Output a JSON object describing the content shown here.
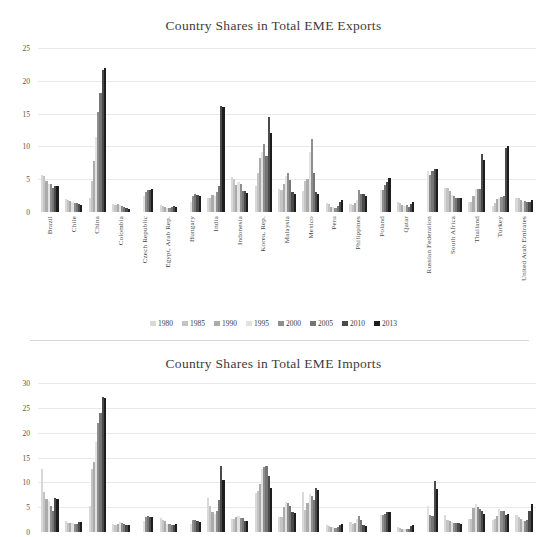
{
  "figure": {
    "divider_color": "#d8d8d8",
    "background": "#ffffff",
    "grid_color": "#e9e9e9"
  },
  "legend": {
    "position": "bottom-center",
    "entries": [
      {
        "label": "1980",
        "color": "#d9d9d9"
      },
      {
        "label": "1985",
        "color": "#c4c4c4"
      },
      {
        "label": "1990",
        "color": "#ababab"
      },
      {
        "label": "1995",
        "color": "#e2e2e2"
      },
      {
        "label": "2000",
        "color": "#8e8e8e"
      },
      {
        "label": "2005",
        "color": "#757575"
      },
      {
        "label": "2010",
        "color": "#4a4a4a"
      },
      {
        "label": "2013",
        "color": "#1d1d1d"
      }
    ]
  },
  "chart_data": [
    {
      "type": "bar",
      "title": "Country Shares in Total EME Exports",
      "xlabel": "",
      "ylabel": "",
      "ylim": [
        0,
        25
      ],
      "yticks": [
        0,
        5,
        10,
        15,
        20,
        25
      ],
      "grid": true,
      "legend_position": "bottom",
      "categories": [
        "Brazil",
        "Chile",
        "China",
        "Colombia",
        "Czech Republic",
        "Egypt, Arab Rep.",
        "Hungary",
        "India",
        "Indonesia",
        "Korea, Rep.",
        "Malaysia",
        "Mexico",
        "Peru",
        "Philippines",
        "Poland",
        "Qatar",
        "Russian Federation",
        "South Africa",
        "Thailand",
        "Turkey",
        "United Arab Emirates"
      ],
      "series": [
        {
          "name": "1980",
          "values": [
            5.6,
            2.0,
            2.2,
            1.2,
            0.0,
            1.0,
            0.0,
            2.1,
            5.3,
            4.0,
            3.5,
            3.2,
            1.4,
            1.2,
            0.0,
            1.6,
            0.0,
            3.6,
            1.6,
            0.9,
            2.1
          ]
        },
        {
          "name": "1985",
          "values": [
            5.5,
            1.9,
            4.7,
            1.1,
            0.0,
            0.9,
            0.0,
            2.1,
            5.0,
            6.0,
            3.3,
            4.8,
            1.2,
            1.1,
            0.0,
            1.4,
            0.0,
            3.7,
            1.5,
            1.3,
            2.1
          ]
        },
        {
          "name": "1990",
          "values": [
            4.7,
            1.7,
            7.8,
            1.2,
            0.0,
            0.8,
            0.0,
            2.6,
            4.1,
            8.3,
            4.3,
            5.0,
            0.8,
            1.3,
            0.0,
            1.0,
            0.0,
            3.2,
            2.5,
            2.0,
            1.8
          ]
        },
        {
          "name": "1995",
          "values": [
            4.3,
            1.6,
            11.5,
            1.1,
            2.4,
            0.6,
            1.5,
            2.4,
            4.6,
            9.2,
            5.5,
            9.2,
            0.7,
            1.8,
            3.3,
            0.9,
            6.2,
            2.6,
            3.5,
            2.1,
            1.5
          ]
        },
        {
          "name": "2000",
          "values": [
            4.2,
            1.4,
            15.2,
            0.9,
            3.1,
            0.6,
            2.4,
            3.0,
            4.2,
            10.4,
            6.0,
            11.1,
            0.6,
            3.3,
            3.4,
            1.0,
            5.6,
            2.4,
            3.5,
            2.3,
            1.7
          ]
        },
        {
          "name": "2005",
          "values": [
            3.7,
            1.4,
            18.1,
            0.8,
            3.4,
            0.7,
            2.7,
            4.0,
            3.2,
            8.6,
            4.9,
            6.0,
            0.9,
            2.7,
            4.1,
            0.8,
            6.2,
            2.1,
            3.5,
            2.5,
            1.6
          ]
        },
        {
          "name": "2010",
          "values": [
            4.0,
            1.2,
            21.7,
            0.6,
            3.3,
            0.9,
            2.6,
            16.2,
            3.2,
            14.5,
            3.0,
            3.0,
            1.6,
            2.7,
            4.5,
            1.2,
            6.5,
            2.2,
            8.8,
            9.7,
            1.5
          ]
        },
        {
          "name": "2013",
          "values": [
            3.9,
            1.1,
            21.9,
            0.5,
            3.5,
            0.7,
            2.4,
            16.0,
            2.9,
            12.1,
            2.8,
            2.8,
            1.8,
            2.5,
            5.2,
            1.6,
            6.6,
            2.1,
            8.0,
            10.0,
            1.9
          ]
        }
      ]
    },
    {
      "type": "bar",
      "title": "Country Shares in Total EME Imports",
      "xlabel": "",
      "ylabel": "",
      "ylim": [
        0,
        30
      ],
      "yticks": [
        0,
        5,
        10,
        15,
        20,
        25,
        30
      ],
      "grid": true,
      "legend_position": "bottom",
      "categories": [
        "Brazil",
        "Chile",
        "China",
        "Colombia",
        "Czech Republic",
        "Egypt, Arab Rep.",
        "Hungary",
        "India",
        "Indonesia",
        "Korea, Rep.",
        "Malaysia",
        "Mexico",
        "Peru",
        "Philippines",
        "Poland",
        "Qatar",
        "Russian Federation",
        "South Africa",
        "Thailand",
        "Turkey",
        "United Arab Emirates"
      ],
      "series": [
        {
          "name": "1980",
          "values": [
            12.6,
            2.2,
            5.3,
            1.6,
            0.0,
            2.8,
            0.0,
            6.9,
            2.6,
            7.8,
            3.0,
            8.1,
            1.4,
            2.0,
            0.0,
            1.0,
            0.0,
            3.4,
            2.7,
            2.5,
            3.4
          ]
        },
        {
          "name": "1985",
          "values": [
            8.1,
            1.8,
            12.7,
            1.5,
            0.0,
            2.5,
            0.0,
            5.2,
            2.6,
            8.2,
            3.1,
            4.5,
            1.2,
            1.6,
            0.0,
            0.9,
            0.0,
            2.5,
            2.6,
            2.6,
            3.0
          ]
        },
        {
          "name": "1990",
          "values": [
            6.6,
            1.8,
            14.0,
            1.6,
            0.0,
            2.2,
            0.0,
            4.0,
            3.0,
            9.7,
            5.1,
            5.8,
            1.0,
            1.9,
            0.0,
            0.7,
            0.0,
            2.3,
            4.9,
            3.3,
            2.7
          ]
        },
        {
          "name": "1995",
          "values": [
            6.2,
            1.8,
            18.2,
            2.0,
            2.3,
            1.7,
            1.7,
            3.6,
            3.3,
            12.7,
            6.1,
            7.6,
            1.0,
            2.6,
            3.4,
            0.6,
            5.3,
            2.1,
            5.7,
            4.6,
            2.2
          ]
        },
        {
          "name": "2000",
          "values": [
            5.2,
            1.6,
            22.0,
            1.8,
            3.1,
            1.6,
            2.5,
            4.3,
            2.8,
            13.0,
            5.9,
            7.2,
            0.9,
            3.3,
            3.5,
            0.7,
            3.5,
            1.8,
            5.0,
            4.2,
            2.2
          ]
        },
        {
          "name": "2005",
          "values": [
            4.3,
            1.6,
            24.0,
            1.6,
            3.3,
            1.5,
            2.5,
            6.5,
            2.8,
            13.2,
            5.2,
            6.5,
            1.1,
            2.5,
            3.7,
            0.7,
            3.3,
            1.8,
            4.7,
            4.3,
            2.5
          ]
        },
        {
          "name": "2010",
          "values": [
            6.9,
            2.0,
            27.1,
            1.4,
            3.1,
            1.5,
            2.3,
            13.2,
            2.3,
            11.3,
            4.0,
            8.8,
            1.5,
            1.4,
            4.0,
            1.3,
            10.3,
            1.8,
            4.2,
            3.4,
            4.3
          ]
        },
        {
          "name": "2013",
          "values": [
            6.6,
            2.0,
            27.0,
            1.5,
            3.0,
            1.6,
            2.1,
            10.4,
            2.2,
            8.8,
            3.8,
            8.4,
            1.6,
            1.2,
            4.1,
            1.5,
            8.6,
            1.6,
            3.6,
            3.6,
            5.7
          ]
        }
      ]
    }
  ]
}
